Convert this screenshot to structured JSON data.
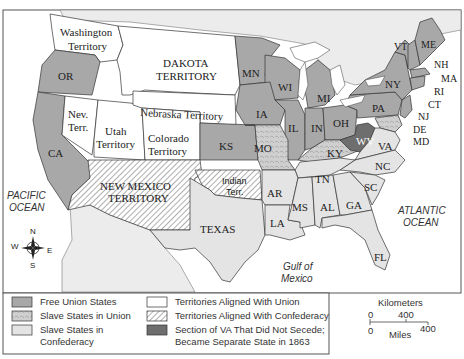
{
  "map": {
    "oceans": {
      "pacific": [
        "PACIFIC",
        "OCEAN"
      ],
      "atlantic": [
        "ATLANTIC",
        "OCEAN"
      ],
      "gulf": [
        "Gulf of",
        "Mexico"
      ]
    },
    "compass": {
      "n": "N",
      "s": "S",
      "e": "E",
      "w": "W"
    },
    "territories_union": {
      "washington": [
        "Washington",
        "Territory"
      ],
      "dakota": [
        "DAKOTA",
        "TERRITORY"
      ],
      "nebraska": "Nebraska Territory",
      "nevada": [
        "Nev.",
        "Terr."
      ],
      "utah": [
        "Utah",
        "Territory"
      ],
      "colorado": [
        "Colorado",
        "Territory"
      ]
    },
    "territories_confederacy": {
      "new_mexico": [
        "NEW MEXICO",
        "TERRITORY"
      ],
      "indian": [
        "Indian",
        "Terr."
      ]
    },
    "free_union_states": [
      "OR",
      "CA",
      "MN",
      "WI",
      "IA",
      "IL",
      "IN",
      "MI",
      "OH",
      "KS",
      "PA",
      "NY",
      "VT",
      "ME",
      "NH",
      "MA",
      "RI",
      "CT",
      "NJ"
    ],
    "slave_states_union": [
      "MO",
      "KY",
      "DE",
      "MD"
    ],
    "slave_states_confederacy": [
      "TEXAS",
      "AR",
      "LA",
      "MS",
      "AL",
      "TN",
      "GA",
      "SC",
      "NC",
      "VA",
      "FL"
    ],
    "separate_state": [
      "WV"
    ]
  },
  "legend": {
    "items": [
      {
        "label": [
          "Free Union States"
        ],
        "swatch": "free"
      },
      {
        "label": [
          "Slave States in Union"
        ],
        "swatch": "border"
      },
      {
        "label": [
          "Slave States in",
          "Confederacy"
        ],
        "swatch": "conf"
      },
      {
        "label": [
          "Territories Aligned With Union"
        ],
        "swatch": "terrU"
      },
      {
        "label": [
          "Territories Aligned With Confederacy"
        ],
        "swatch": "terrC"
      },
      {
        "label": [
          "Section of VA That Did Not Secede;",
          "Became Separate State in 1863"
        ],
        "swatch": "wv"
      }
    ]
  },
  "scale": {
    "km_label": "Kilometers",
    "km_ticks": [
      "0",
      "400"
    ],
    "mi_ticks": [
      "0",
      "400"
    ],
    "mi_label": "Miles"
  },
  "colors": {
    "free": "#a8a8a8",
    "border": "#cfcfcf",
    "confederacy": "#e4e4e4",
    "territory_union": "#ffffff",
    "west_virginia": "#6e6e6e"
  }
}
